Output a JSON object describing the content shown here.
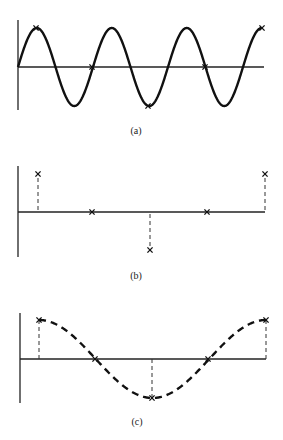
{
  "figure": {
    "panels": [
      {
        "id": "a",
        "caption": "(a)",
        "description": "Original high-frequency sinusoid with sample points marked",
        "axis": {
          "x0": 18,
          "x1": 264,
          "y_zero": 67,
          "y_top": 20,
          "y_bottom": 110
        },
        "curve": {
          "type": "sine",
          "style": "solid",
          "x_start": 18,
          "period_px": 75,
          "amplitude_px": 39,
          "cycles": 3.25
        },
        "samples": [
          {
            "x": 36,
            "value": 1
          },
          {
            "x": 92,
            "value": 0
          },
          {
            "x": 148,
            "value": -1
          },
          {
            "x": 205,
            "value": 0
          },
          {
            "x": 262,
            "value": 1
          }
        ],
        "caption_pos": {
          "x": 136,
          "y": 134
        }
      },
      {
        "id": "b",
        "caption": "(b)",
        "description": "Sampled values only, shown as X markers with dashed stems",
        "axis": {
          "x0": 18,
          "x1": 265,
          "y_zero": 212,
          "y_top": 166,
          "y_bottom": 257
        },
        "amplitude_px": 38,
        "samples": [
          {
            "x": 38,
            "value": 1
          },
          {
            "x": 92,
            "value": 0
          },
          {
            "x": 150,
            "value": -1
          },
          {
            "x": 207,
            "value": 0
          },
          {
            "x": 265,
            "value": 1
          }
        ],
        "caption_pos": {
          "x": 136,
          "y": 279
        }
      },
      {
        "id": "c",
        "caption": "(c)",
        "description": "Reconstructed low-frequency alias through the samples (dashed)",
        "axis": {
          "x0": 20,
          "x1": 266,
          "y_zero": 359,
          "y_top": 313,
          "y_bottom": 403
        },
        "amplitude_px": 39,
        "curve": {
          "type": "cosine",
          "style": "dashed",
          "x_start": 39,
          "x_end": 266,
          "period_px": 227
        },
        "samples": [
          {
            "x": 39,
            "value": 1
          },
          {
            "x": 95,
            "value": 0
          },
          {
            "x": 152,
            "value": -1
          },
          {
            "x": 208,
            "value": 0
          },
          {
            "x": 266,
            "value": 1
          }
        ],
        "caption_pos": {
          "x": 137,
          "y": 425
        }
      }
    ]
  },
  "colors": {
    "ink": "#111111",
    "background": "#ffffff"
  }
}
